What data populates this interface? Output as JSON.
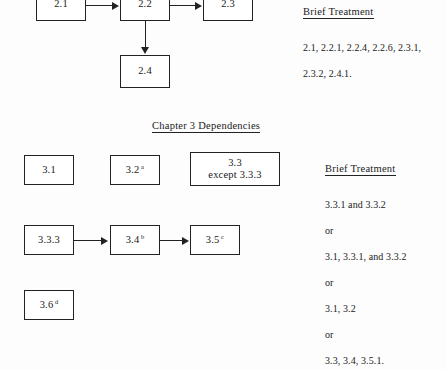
{
  "document": {
    "type": "chapter-dependency-diagram"
  },
  "chapter2": {
    "nodes": [
      {
        "id": "n2-1",
        "label": "2.1",
        "sup": ""
      },
      {
        "id": "n2-2",
        "label": "2.2",
        "sup": ""
      },
      {
        "id": "n2-3",
        "label": "2.3",
        "sup": ""
      },
      {
        "id": "n2-4",
        "label": "2.4",
        "sup": ""
      }
    ],
    "panel": {
      "title": "Brief Treatment",
      "lines": [
        "2.1, 2.2.1, 2.2.4, 2.2.6, 2.3.1,",
        "2.3.2, 2.4.1."
      ]
    }
  },
  "chapter3": {
    "heading": "Chapter 3  Dependencies",
    "nodes": [
      {
        "id": "n3-1",
        "label": "3.1",
        "sup": ""
      },
      {
        "id": "n3-2",
        "label": "3.2",
        "sup": "a"
      },
      {
        "id": "n3-3",
        "label": "3.3",
        "label2": "except 3.3.3",
        "sup": ""
      },
      {
        "id": "n3-33",
        "label": "3.3.3",
        "sup": ""
      },
      {
        "id": "n3-4",
        "label": "3.4",
        "sup": "b"
      },
      {
        "id": "n3-5",
        "label": "3.5",
        "sup": "c"
      },
      {
        "id": "n3-6",
        "label": "3.6",
        "sup": "d"
      }
    ],
    "panel": {
      "title": "Brief Treatment",
      "lines": [
        "3.3.1 and 3.3.2",
        "or",
        "3.1, 3.3.1, and 3.3.2",
        "or",
        "3.1, 3.2",
        "or",
        "3.3, 3.4, 3.5.1."
      ]
    }
  },
  "colors": {
    "ink": "#1a1a1a",
    "rule": "#222222",
    "page": "#fdfdfd"
  }
}
